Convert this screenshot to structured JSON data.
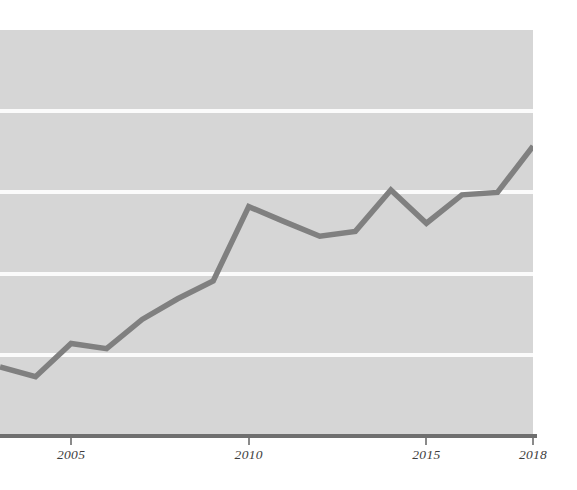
{
  "chart_data": {
    "type": "line",
    "title": "",
    "subtitle": "",
    "xlabel": "",
    "ylabel": "",
    "xlim": [
      2003,
      2018
    ],
    "ylim": [
      0,
      100
    ],
    "grid": true,
    "grid_axis": "y",
    "legend": false,
    "legend_position": "none",
    "x_tick_labels": [
      "2005",
      "2010",
      "2015",
      "2018"
    ],
    "x_tick_values": [
      2005,
      2010,
      2015,
      2018
    ],
    "y_tick_labels": [],
    "y_gridline_values": [
      20,
      40,
      60,
      80
    ],
    "series": [
      {
        "name": "series-1",
        "color": "#808080",
        "line_width": 5.5,
        "x": [
          2003,
          2004,
          2005,
          2006,
          2007,
          2008,
          2009,
          2010,
          2011,
          2012,
          2013,
          2014,
          2015,
          2016,
          2017,
          2018
        ],
        "values": [
          17.0,
          14.6,
          22.8,
          21.5,
          28.7,
          33.8,
          38.2,
          56.5,
          52.8,
          49.2,
          50.4,
          60.6,
          52.4,
          59.4,
          60.0,
          71.4
        ]
      }
    ],
    "annotations": []
  },
  "style": {
    "panel_color": "#d6d6d6",
    "gridline_color": "#fbfbfb",
    "axis_color": "#6f6f6f",
    "tick_color": "#8a8a8a",
    "label_color": "#3d3d3d",
    "line_color": "#808080",
    "background_color": "#ffffff"
  }
}
